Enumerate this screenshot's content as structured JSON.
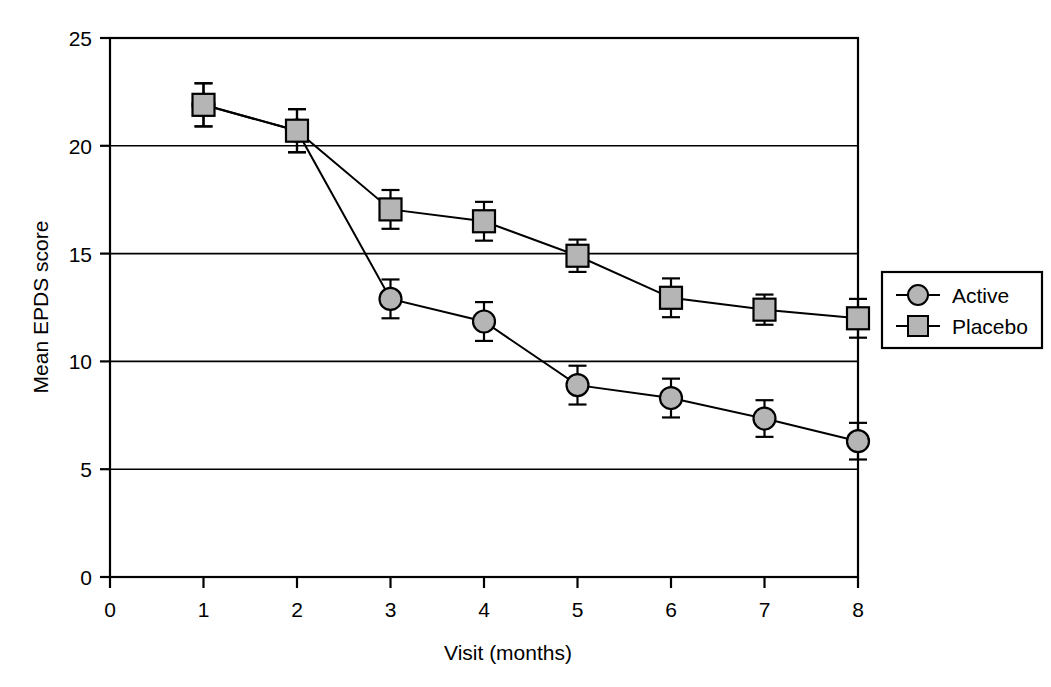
{
  "chart_data": {
    "type": "line",
    "title": "",
    "xlabel": "Visit (months)",
    "ylabel": "Mean EPDS score",
    "x": [
      1,
      2,
      3,
      4,
      5,
      6,
      7,
      8
    ],
    "xlim": [
      0,
      8
    ],
    "ylim": [
      0,
      25
    ],
    "xticks": [
      "0",
      "1",
      "2",
      "3",
      "4",
      "5",
      "6",
      "7",
      "8"
    ],
    "yticks": [
      "0",
      "5",
      "10",
      "15",
      "20",
      "25"
    ],
    "grid": "horizontal",
    "legend_position": "right",
    "series": [
      {
        "name": "Active",
        "marker": "circle",
        "marker_fill": "#b5b5b5",
        "marker_stroke": "#000000",
        "values": [
          21.9,
          20.7,
          12.9,
          11.85,
          8.9,
          8.3,
          7.35,
          6.3
        ],
        "errors": [
          1.0,
          1.0,
          0.9,
          0.9,
          0.9,
          0.9,
          0.85,
          0.85
        ]
      },
      {
        "name": "Placebo",
        "marker": "square",
        "marker_fill": "#b5b5b5",
        "marker_stroke": "#000000",
        "values": [
          21.9,
          20.7,
          17.05,
          16.5,
          14.9,
          12.95,
          12.4,
          12.0
        ],
        "errors": [
          1.0,
          1.0,
          0.9,
          0.9,
          0.75,
          0.9,
          0.7,
          0.9
        ]
      }
    ]
  },
  "axes": {
    "y_title": "Mean EPDS score",
    "x_title": "Visit (months)",
    "y_tick_labels": [
      "25",
      "20",
      "15",
      "10",
      "5",
      "0"
    ],
    "x_tick_labels": [
      "0",
      "1",
      "2",
      "3",
      "4",
      "5",
      "6",
      "7",
      "8"
    ]
  },
  "legend": {
    "entries": [
      {
        "label": "Active",
        "marker": "circle"
      },
      {
        "label": "Placebo",
        "marker": "square"
      }
    ]
  },
  "colors": {
    "marker_fill": "#b5b5b5",
    "line": "#000000",
    "axis": "#000000",
    "grid": "#000000",
    "background": "#ffffff"
  }
}
